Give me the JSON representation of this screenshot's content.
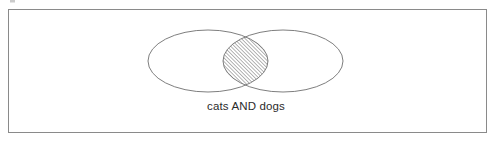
{
  "figure": {
    "name": "venn-diagram-boolean-and",
    "caption": "cats AND dogs",
    "background_color": "#ffffff",
    "border": {
      "visible": true,
      "color": "#8a8a8a",
      "width_px": 1,
      "bounds": {
        "x": 8,
        "y": 9,
        "width": 479,
        "height": 124
      }
    },
    "sets": [
      {
        "id": "left-set",
        "label": "cats",
        "shape": "ellipse",
        "center_x": 208,
        "center_y": 61,
        "radius_x": 60,
        "radius_y": 31,
        "stroke_color": "#6f6f6f",
        "fill": "none"
      },
      {
        "id": "right-set",
        "label": "dogs",
        "shape": "ellipse",
        "center_x": 283,
        "center_y": 61,
        "radius_x": 60,
        "radius_y": 31,
        "stroke_color": "#6f6f6f",
        "fill": "none"
      }
    ],
    "intersection": {
      "id": "intersection-region",
      "label": "cats AND dogs",
      "highlighted": true,
      "fill_pattern": "diagonal-hatch",
      "hatch_angle_degrees": 45,
      "hatch_spacing_px": 2,
      "hatch_color": "#7d7d7d",
      "stroke_color": "#6f6f6f",
      "bounds": {
        "x": 222,
        "y": 32,
        "width": 46,
        "height": 56
      }
    },
    "caption_position": {
      "x": 246,
      "y": 110,
      "anchor": "middle"
    },
    "artifact": {
      "name": "scan-smudge",
      "visible": true,
      "x": 10,
      "y": 0,
      "width": 5,
      "height": 3,
      "color": "#b9b9b9"
    }
  }
}
